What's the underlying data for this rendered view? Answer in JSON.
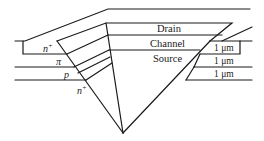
{
  "diagram": {
    "regions": {
      "drain": "Drain",
      "channel": "Channel",
      "source": "Source"
    },
    "layers_left": {
      "n_plus_top": "n",
      "n_plus_top_sup": "+",
      "pi": "π",
      "p": "p",
      "n_plus_bottom": "n",
      "n_plus_bottom_sup": "+"
    },
    "thickness_labels": [
      "1 μm",
      "1 μm",
      "1 μm"
    ]
  }
}
